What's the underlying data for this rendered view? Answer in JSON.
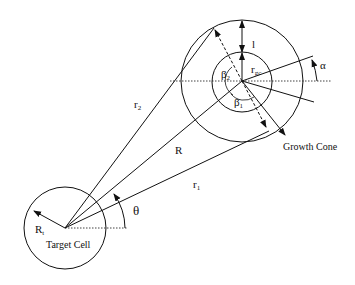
{
  "labels": {
    "r2": "r",
    "r2_sub": "2",
    "R": "R",
    "r1": "r",
    "r1_sub": "1",
    "l": "l",
    "rgc": "r",
    "rgc_sub": "gc",
    "beta2": "β",
    "beta2_sub": "2",
    "beta1": "β",
    "beta1_sub": "1",
    "alpha": "α",
    "theta": "θ",
    "Rt": "R",
    "Rt_sub": "t",
    "growth_cone": "Growth Cone",
    "target_cell": "Target Cell"
  },
  "colors": {
    "stroke": "#111111",
    "background": "#ffffff"
  }
}
